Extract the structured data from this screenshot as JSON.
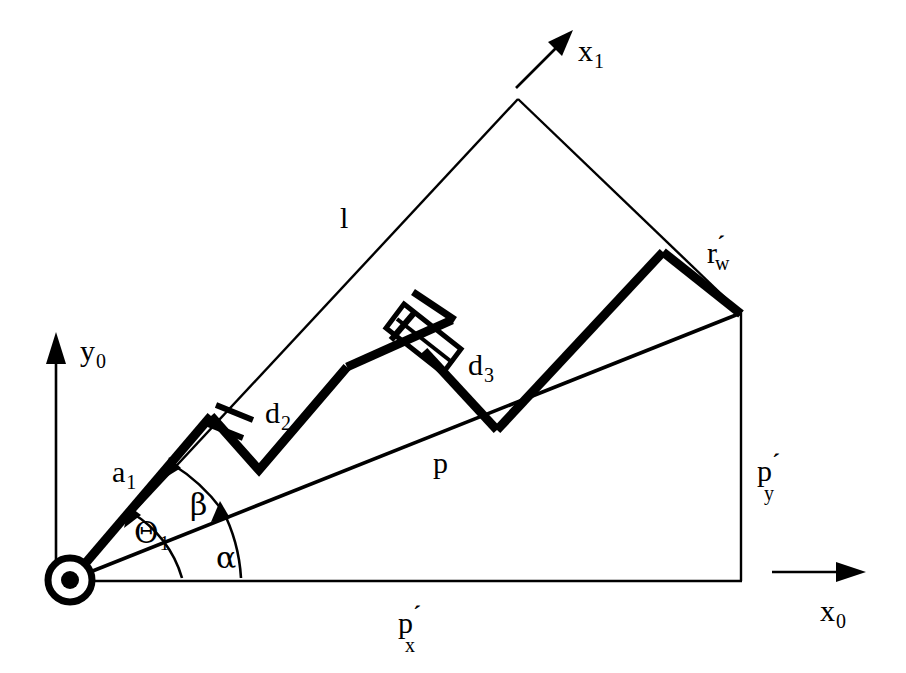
{
  "figure": {
    "type": "kinematic-diagram",
    "background_color": "#ffffff",
    "ink_color": "#000000"
  },
  "axes": {
    "y0": {
      "label_base": "y",
      "label_sub": "0",
      "direction": "up"
    },
    "x0": {
      "label_base": "x",
      "label_sub": "0",
      "direction": "right"
    },
    "x1": {
      "label_base": "x",
      "label_sub": "1",
      "direction": "up-right"
    }
  },
  "angles": [
    {
      "name": "theta1",
      "label_base": "Θ",
      "label_sub": "1"
    },
    {
      "name": "alpha",
      "label_base": "α",
      "label_sub": ""
    },
    {
      "name": "beta",
      "label_base": "β",
      "label_sub": ""
    }
  ],
  "links": [
    {
      "name": "a1",
      "label_base": "a",
      "label_sub": "1",
      "prime": ""
    },
    {
      "name": "d2",
      "label_base": "d",
      "label_sub": "2",
      "prime": ""
    },
    {
      "name": "d3",
      "label_base": "d",
      "label_sub": "3",
      "prime": ""
    },
    {
      "name": "r_w",
      "label_base": "r",
      "label_sub": "w",
      "prime": "´"
    },
    {
      "name": "l",
      "label_base": "l",
      "label_sub": "",
      "prime": ""
    },
    {
      "name": "p",
      "label_base": "p",
      "label_sub": "",
      "prime": ""
    }
  ],
  "components": [
    {
      "name": "p_x",
      "label_base": "p",
      "label_sub": "x",
      "prime": "´"
    },
    {
      "name": "p_y",
      "label_base": "p",
      "label_sub": "y",
      "prime": "´"
    }
  ],
  "geometry": {
    "origin": [
      70,
      580
    ],
    "apex_x1": [
      518,
      97
    ],
    "wrist_right": [
      740,
      313
    ],
    "r_w_top": [
      663,
      252
    ],
    "p_end": [
      740,
      313
    ],
    "base_joint_symbol": "concentric-circle"
  }
}
